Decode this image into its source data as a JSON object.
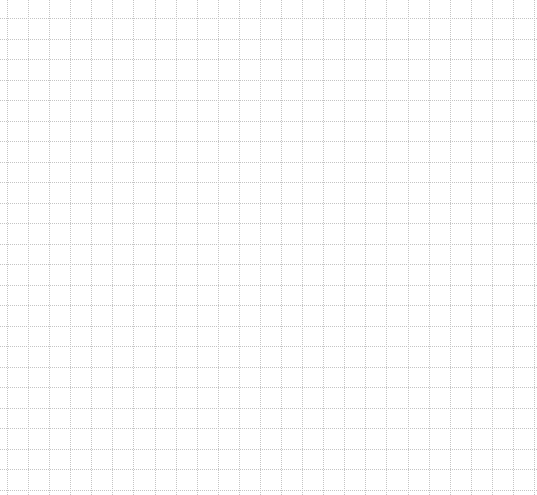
{
  "grid": {
    "width": 537,
    "height": 495,
    "line_color": "#c4c4c4",
    "line_style": "dotted",
    "background": "#ffffff",
    "vertical": {
      "start": 7,
      "spacing": 21.08,
      "count": 26
    },
    "horizontal": {
      "start": 18,
      "spacing": 20.5,
      "count": 24
    }
  }
}
